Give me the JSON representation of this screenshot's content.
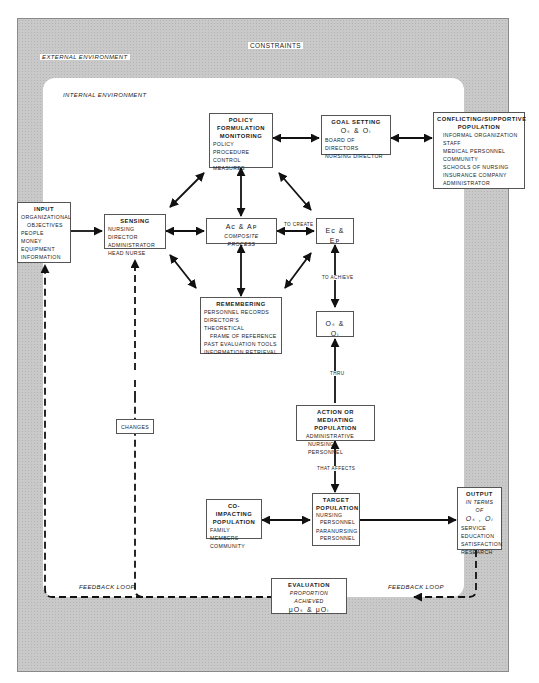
{
  "diagram": {
    "external_label": "EXTERNAL ENVIRONMENT",
    "constraints_label": "CONSTRAINTS",
    "internal_label": "INTERNAL ENVIRONMENT",
    "feedback_left": "FEEDBACK LOOP",
    "feedback_right": "FEEDBACK LOOP",
    "connectors": {
      "to_create": "TO CREATE",
      "to_achieve": "TO ACHIEVE",
      "thru": "THRU",
      "that_affects": "THAT AFFECTS"
    }
  },
  "boxes": {
    "input": {
      "title": "INPUT",
      "items": [
        "ORGANIZATIONAL",
        "OBJECTIVES",
        "PEOPLE",
        "MONEY",
        "EQUIPMENT",
        "INFORMATION"
      ]
    },
    "sensing": {
      "title": "SENSING",
      "items": [
        "NURSING DIRECTOR",
        "ADMINISTRATOR",
        "HEAD NURSE"
      ]
    },
    "policy": {
      "title_lines": [
        "POLICY",
        "FORMULATION",
        "MONITORING"
      ],
      "items": [
        "POLICY",
        "PROCEDURE",
        "CONTROL MEASURES"
      ]
    },
    "goal_setting": {
      "title": "GOAL SETTING",
      "symbol": "Oₛ & Oᵢ",
      "items": [
        "BOARD OF DIRECTORS",
        "NURSING DIRECTOR"
      ]
    },
    "conflicting": {
      "title_lines": [
        "CONFLICTING/SUPPORTIVE",
        "POPULATION"
      ],
      "items": [
        "INFORMAL ORGANIZATION",
        "STAFF",
        "MEDICAL PERSONNEL",
        "COMMUNITY",
        "SCHOOLS OF NURSING",
        "INSURANCE COMPANY",
        "ADMINISTRATOR"
      ]
    },
    "composite": {
      "symbol": "Aᴄ & Aᴘ",
      "subtitle": "COMPOSITE PROCESS"
    },
    "ec_ep": {
      "symbol": "Eᴄ & Eᴘ"
    },
    "remembering": {
      "title": "REMEMBERING",
      "items": [
        "PERSONNEL RECORDS",
        "DIRECTOR'S THEORETICAL",
        "FRAME OF REFERENCE",
        "PAST EVALUATION TOOLS",
        "INFORMATION RETRIEVAL"
      ]
    },
    "os_oi": {
      "symbol": "Oₛ & Oᵢ"
    },
    "action": {
      "title_lines": [
        "ACTION OR MEDIATING",
        "POPULATION"
      ],
      "items": [
        "ADMINISTRATIVE",
        "NURSING PERSONNEL"
      ]
    },
    "co_impacting": {
      "title_lines": [
        "CO-IMPACTING",
        "POPULATION"
      ],
      "items": [
        "FAMILY MEMBERS",
        "COMMUNITY"
      ]
    },
    "target": {
      "title_lines": [
        "TARGET",
        "POPULATION"
      ],
      "items": [
        "NURSING",
        "PERSONNEL",
        "PARANURSING",
        "PERSONNEL"
      ]
    },
    "output": {
      "title": "OUTPUT",
      "subtitle": "IN TERMS OF",
      "symbol": "Oₛ , Oᵢ",
      "items": [
        "SERVICE",
        "EDUCATION",
        "SATISFACTION",
        "RESEARCH"
      ]
    },
    "changes": {
      "label": "CHANGES"
    },
    "evaluation": {
      "title": "EVALUATION",
      "subtitle": "PROPORTION ACHIEVED",
      "symbol": "μOₛ & μOᵢ"
    }
  }
}
